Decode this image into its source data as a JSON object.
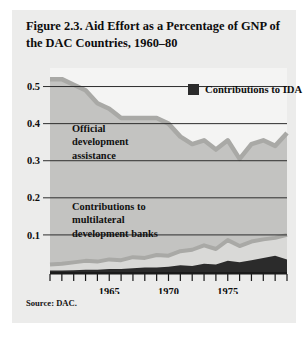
{
  "figure": {
    "title": "Figure 2.3.  Aid Effort as a Percentage of GNP of the DAC Countries, 1960–80",
    "source": "Source: DAC.",
    "panel_bg": "#ececeb"
  },
  "legend": {
    "items": [
      {
        "label": "Contributions to IDA",
        "color": "#2b2b2b"
      }
    ]
  },
  "annotations": [
    {
      "id": "oda",
      "text": "Official\ndevelopment\nassistance"
    },
    {
      "id": "multilateral",
      "text": "Contributions to\nmultilateral\ndevelopment banks"
    }
  ],
  "chart_data": {
    "type": "area",
    "title": "Aid Effort as a Percentage of GNP of the DAC Countries, 1960–80",
    "xlabel": "",
    "ylabel": "",
    "grid": true,
    "legend_position": "top-right",
    "xlim": [
      1960,
      1980
    ],
    "ylim": [
      0,
      0.55
    ],
    "yticks": [
      0.1,
      0.2,
      0.3,
      0.4,
      0.5
    ],
    "ytick_labels": [
      "0.1",
      "0.2",
      "0.3",
      "0.4",
      "0.5"
    ],
    "xticks": [
      1960,
      1961,
      1962,
      1963,
      1964,
      1965,
      1966,
      1967,
      1968,
      1969,
      1970,
      1971,
      1972,
      1973,
      1974,
      1975,
      1976,
      1977,
      1978,
      1979,
      1980
    ],
    "xtick_labels_shown": [
      "1965",
      "1970",
      "1975"
    ],
    "x": [
      1960,
      1961,
      1962,
      1963,
      1964,
      1965,
      1966,
      1967,
      1968,
      1969,
      1970,
      1971,
      1972,
      1973,
      1974,
      1975,
      1976,
      1977,
      1978,
      1979,
      1980
    ],
    "series": [
      {
        "name": "Official development assistance",
        "color": "#c3c3c1",
        "line_color": "#a9a9a6",
        "values": [
          0.52,
          0.52,
          0.505,
          0.49,
          0.455,
          0.44,
          0.415,
          0.415,
          0.415,
          0.415,
          0.4,
          0.365,
          0.345,
          0.355,
          0.33,
          0.355,
          0.305,
          0.345,
          0.355,
          0.34,
          0.375
        ]
      },
      {
        "name": "Contributions to multilateral development banks",
        "color": "#d9d9d7",
        "line_color": "#a9a9a6",
        "values": [
          0.02,
          0.022,
          0.026,
          0.03,
          0.028,
          0.034,
          0.032,
          0.04,
          0.038,
          0.046,
          0.044,
          0.056,
          0.06,
          0.072,
          0.062,
          0.086,
          0.07,
          0.082,
          0.088,
          0.092,
          0.1
        ]
      },
      {
        "name": "Contributions to IDA",
        "color": "#2b2b2b",
        "line_color": "#2b2b2b",
        "values": [
          0.004,
          0.004,
          0.005,
          0.006,
          0.006,
          0.008,
          0.008,
          0.01,
          0.012,
          0.012,
          0.014,
          0.018,
          0.016,
          0.022,
          0.02,
          0.03,
          0.026,
          0.032,
          0.038,
          0.044,
          0.034
        ]
      }
    ]
  }
}
